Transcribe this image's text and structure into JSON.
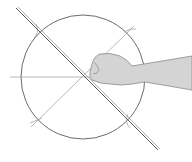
{
  "diagram": {
    "title": "",
    "colors": {
      "background": "#ffffff",
      "circle": "#6b6b6b",
      "ruler": "#5a5a5a",
      "construction": "#9a9a9a",
      "hand_fill": "#d4d4d4",
      "hand_stroke": "#8a8a8a"
    },
    "elements": [
      "circle",
      "ruler-line",
      "horizontal-construction-line",
      "diagonal-construction-line",
      "hand"
    ]
  }
}
